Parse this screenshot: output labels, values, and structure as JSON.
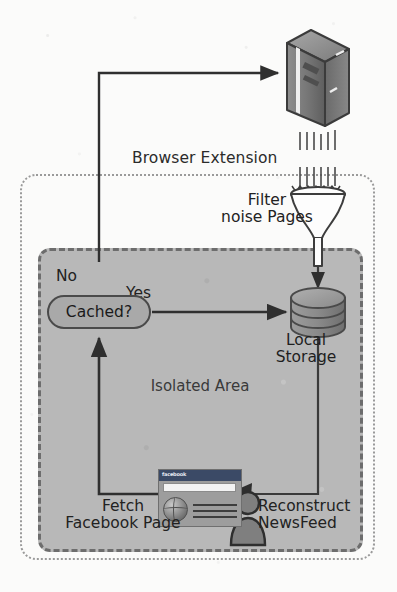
{
  "diagram": {
    "containers": {
      "browser_extension": {
        "label": "Browser Extension"
      },
      "isolated_area": {
        "label": "Isolated Area"
      }
    },
    "nodes": {
      "server": {
        "icon": "server-tower-icon",
        "label": ""
      },
      "filter": {
        "icon": "funnel-icon",
        "label": "Filter\nnoise Pages"
      },
      "local_storage": {
        "icon": "database-cylinder-icon",
        "label": "Local\nStorage"
      },
      "cached_decision": {
        "label": "Cached?"
      },
      "facebook_page": {
        "icon": "browser-window-icon",
        "brand": "facebook",
        "label": "Fetch\nFacebook Page"
      },
      "user": {
        "icon": "person-icon",
        "label": "Reconstruct\nNewsFeed"
      }
    },
    "edge_labels": {
      "no": "No",
      "yes": "Yes"
    },
    "colors": {
      "isolated_area_fill": "#b8b8b8",
      "node_fill": "#a9a9a9",
      "stroke": "#3a3a3a",
      "dotted_border": "#9a9a9a",
      "dashed_border": "#6d6d6d",
      "facebook_titlebar": "#3b4a66",
      "page_background": "#fbfbfa"
    }
  }
}
